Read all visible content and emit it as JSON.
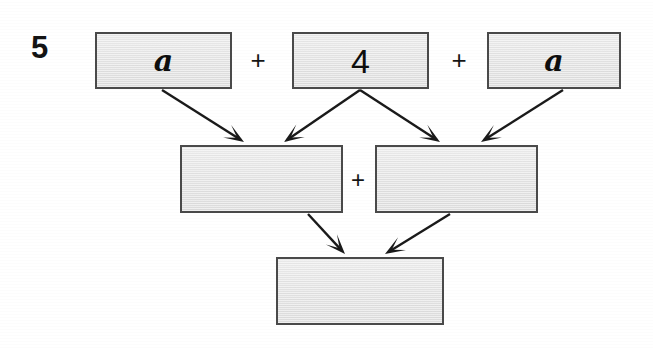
{
  "page": {
    "width": 653,
    "height": 348,
    "background_color": "#ffffff",
    "type": "worksheet-diagram"
  },
  "question": {
    "number": "5"
  },
  "colors": {
    "box_fill": "#e4e4e4",
    "box_border": "#4a4a4a",
    "text": "#0e0e0e",
    "arrow": "#1a1a1a",
    "background": "#ffffff"
  },
  "diagram": {
    "rows": [
      {
        "name": "top-row",
        "boxes": [
          {
            "id": "top-left",
            "label": "a",
            "label_style": "var",
            "filled": true,
            "x": 95,
            "y": 32,
            "w": 137,
            "h": 57
          },
          {
            "id": "top-middle",
            "label": "4",
            "label_style": "num",
            "filled": true,
            "x": 292,
            "y": 32,
            "w": 137,
            "h": 57
          },
          {
            "id": "top-right",
            "label": "a",
            "label_style": "var",
            "filled": true,
            "x": 487,
            "y": 32,
            "w": 134,
            "h": 57
          }
        ],
        "operators": [
          {
            "id": "plus-top-1",
            "symbol": "+",
            "x": 258,
            "y": 60,
            "size": 26
          },
          {
            "id": "plus-top-2",
            "symbol": "+",
            "x": 459,
            "y": 60,
            "size": 26
          }
        ]
      },
      {
        "name": "middle-row",
        "boxes": [
          {
            "id": "middle-left",
            "label": "",
            "label_style": "none",
            "filled": false,
            "x": 180,
            "y": 145,
            "w": 163,
            "h": 68
          },
          {
            "id": "middle-right",
            "label": "",
            "label_style": "none",
            "filled": false,
            "x": 375,
            "y": 145,
            "w": 163,
            "h": 68
          }
        ],
        "operators": [
          {
            "id": "plus-middle-1",
            "symbol": "+",
            "x": 358,
            "y": 180,
            "size": 24
          }
        ]
      },
      {
        "name": "bottom-row",
        "boxes": [
          {
            "id": "bottom",
            "label": "",
            "label_style": "none",
            "filled": false,
            "x": 276,
            "y": 257,
            "w": 168,
            "h": 68
          }
        ],
        "operators": []
      }
    ],
    "arrows": [
      {
        "id": "arrow-top-left-to-middle-left",
        "from": "top-left",
        "to": "middle-left",
        "x1": 162,
        "y1": 90,
        "x2": 244,
        "y2": 142
      },
      {
        "id": "arrow-top-middle-to-middle-left",
        "from": "top-middle",
        "to": "middle-left",
        "x1": 360,
        "y1": 90,
        "x2": 284,
        "y2": 142
      },
      {
        "id": "arrow-top-middle-to-middle-right",
        "from": "top-middle",
        "to": "middle-right",
        "x1": 360,
        "y1": 90,
        "x2": 440,
        "y2": 142
      },
      {
        "id": "arrow-top-right-to-middle-right",
        "from": "top-right",
        "to": "middle-right",
        "x1": 563,
        "y1": 90,
        "x2": 481,
        "y2": 142
      },
      {
        "id": "arrow-middle-left-to-bottom",
        "from": "middle-left",
        "to": "bottom",
        "x1": 308,
        "y1": 214,
        "x2": 345,
        "y2": 254
      },
      {
        "id": "arrow-middle-right-to-bottom",
        "from": "middle-right",
        "to": "bottom",
        "x1": 450,
        "y1": 214,
        "x2": 385,
        "y2": 254
      }
    ]
  }
}
